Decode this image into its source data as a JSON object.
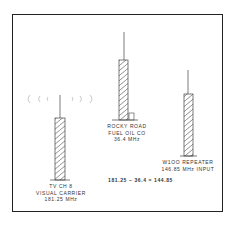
{
  "diagram": {
    "towers": [
      {
        "id": "tv",
        "lines": [
          "TV CH 8",
          "VISUAL CARRIER",
          "181.25 MHz"
        ]
      },
      {
        "id": "rocky",
        "lines": [
          "ROCKY ROAD",
          "FUEL OIL CO",
          "36.4 MHz"
        ]
      },
      {
        "id": "repeater",
        "lines": [
          "W1OO REPEATER",
          "146.85 MHz INPUT"
        ]
      }
    ],
    "equation": "181.25 − 36.4 = 144.85",
    "colors": {
      "line": "#333333",
      "wave": "#bbbbbb"
    }
  }
}
